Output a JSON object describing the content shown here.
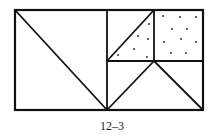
{
  "figure": {
    "caption": "12–3",
    "stroke_color": "#111111",
    "dot_color": "#222222",
    "outer_rect": {
      "x": 15,
      "y": 10,
      "w": 188,
      "h": 100
    },
    "lines": [
      {
        "name": "left-square-right-edge",
        "x1": 107,
        "y1": 10,
        "x2": 107,
        "y2": 110
      },
      {
        "name": "left-square-diagonal",
        "x1": 15,
        "y1": 10,
        "x2": 107,
        "y2": 110
      },
      {
        "name": "right-midline",
        "x1": 107,
        "y1": 61,
        "x2": 203,
        "y2": 61
      },
      {
        "name": "upper-middle-divider",
        "x1": 154,
        "y1": 10,
        "x2": 154,
        "y2": 61
      },
      {
        "name": "upper-triangle-diagonal",
        "x1": 107,
        "y1": 61,
        "x2": 154,
        "y2": 10
      },
      {
        "name": "lower-left-slant",
        "x1": 154,
        "y1": 61,
        "x2": 107,
        "y2": 110
      },
      {
        "name": "lower-right-slant",
        "x1": 154,
        "y1": 61,
        "x2": 203,
        "y2": 110
      }
    ],
    "shaded_regions": [
      {
        "name": "dotted-triangle",
        "dots": [
          [
            149,
            24
          ],
          [
            138,
            36
          ],
          [
            148,
            39
          ],
          [
            134,
            49
          ],
          [
            118,
            55
          ],
          [
            147,
            57
          ]
        ]
      },
      {
        "name": "dotted-square",
        "dots": [
          [
            163,
            16
          ],
          [
            180,
            17
          ],
          [
            196,
            17
          ],
          [
            172,
            29
          ],
          [
            187,
            29
          ],
          [
            164,
            42
          ],
          [
            181,
            39
          ],
          [
            196,
            42
          ],
          [
            171,
            53
          ],
          [
            186,
            53
          ]
        ]
      }
    ]
  }
}
